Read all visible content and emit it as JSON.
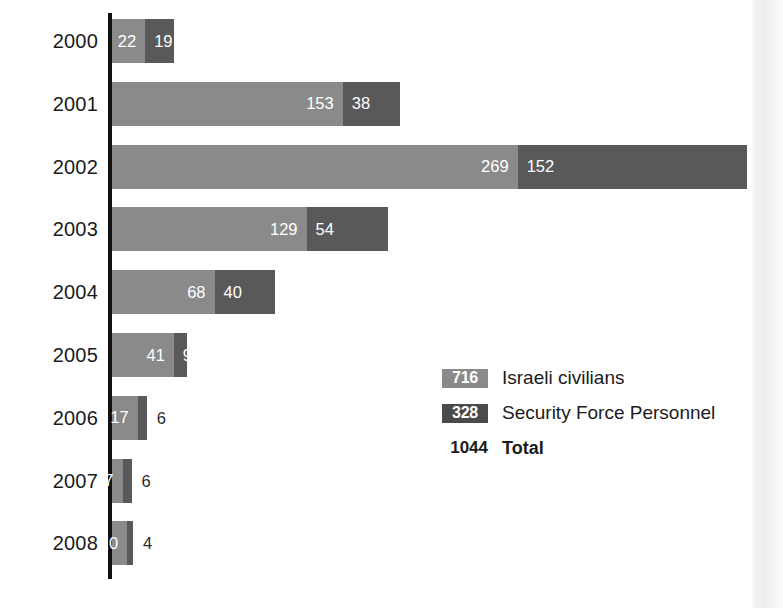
{
  "chart_data": {
    "type": "bar",
    "orientation": "horizontal",
    "stacked": true,
    "title": "",
    "subtitle": "",
    "xlabel": "",
    "ylabel": "",
    "grid": false,
    "legend_position": "inside-right",
    "categories": [
      "2000",
      "2001",
      "2002",
      "2003",
      "2004",
      "2005",
      "2006",
      "2007",
      "2008"
    ],
    "series": [
      {
        "name": "Israeli civilians",
        "color": "#8a8a8a",
        "total": 716,
        "values": [
          22,
          153,
          269,
          129,
          68,
          41,
          17,
          7,
          10
        ]
      },
      {
        "name": "Security Force Personnel",
        "color": "#595959",
        "total": 328,
        "values": [
          19,
          38,
          152,
          54,
          40,
          9,
          6,
          6,
          4
        ]
      }
    ],
    "totals": [
      41,
      191,
      421,
      183,
      108,
      50,
      23,
      13,
      14
    ],
    "grand_total": 1044,
    "xlim": [
      0,
      421
    ],
    "axis_at_zero": true
  },
  "rows": [
    {
      "year": "2000",
      "civilians": "22",
      "security": "19",
      "civ_inside": true,
      "sec_inside": true
    },
    {
      "year": "2001",
      "civilians": "153",
      "security": "38",
      "civ_inside": true,
      "sec_inside": true
    },
    {
      "year": "2002",
      "civilians": "269",
      "security": "152",
      "civ_inside": true,
      "sec_inside": true
    },
    {
      "year": "2003",
      "civilians": "129",
      "security": "54",
      "civ_inside": true,
      "sec_inside": true
    },
    {
      "year": "2004",
      "civilians": "68",
      "security": "40",
      "civ_inside": true,
      "sec_inside": true
    },
    {
      "year": "2005",
      "civilians": "41",
      "security": "9",
      "civ_inside": true,
      "sec_inside": true
    },
    {
      "year": "2006",
      "civilians": "17",
      "security": "6",
      "civ_inside": true,
      "sec_inside": false
    },
    {
      "year": "2007",
      "civilians": "7",
      "security": "6",
      "civ_inside": true,
      "sec_inside": false
    },
    {
      "year": "2008",
      "civilians": "10",
      "security": "4",
      "civ_inside": true,
      "sec_inside": false
    }
  ],
  "legend": {
    "civilians": {
      "value": "716",
      "label": "Israeli civilians",
      "color": "#8a8a8a"
    },
    "security": {
      "value": "328",
      "label": "Security Force Personnel",
      "color": "#4a4a4a"
    },
    "total": {
      "value": "1044",
      "label": "Total"
    }
  },
  "colors": {
    "civilians": "#8a8a8a",
    "security": "#595959",
    "axis": "#111111",
    "text": "#1b1b1b",
    "background": "#ffffff"
  }
}
